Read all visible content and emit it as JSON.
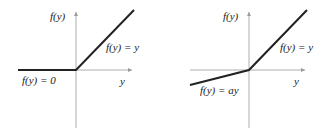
{
  "diagrams": [
    {
      "name": "ReLU",
      "y_axis_label": "f(y)",
      "x_axis_label": "y",
      "positive_label": "f(y) = y",
      "negative_label": "f(y) = 0"
    },
    {
      "name": "Leaky ReLU",
      "y_axis_label": "f(y)",
      "x_axis_label": "y",
      "positive_label": "f(y) = y",
      "negative_label": "f(y) = ay"
    }
  ],
  "colors": {
    "axis": "#9a9a9a",
    "curve": "#222222"
  }
}
